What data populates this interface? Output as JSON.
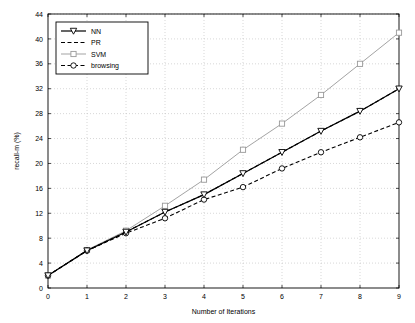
{
  "chart_data": {
    "type": "line",
    "title": "",
    "xlabel": "Number of Iterations",
    "ylabel": "recall-m (%)",
    "xlim": [
      0,
      9
    ],
    "ylim": [
      0,
      44
    ],
    "grid": true,
    "legend_position": "top-left",
    "x": [
      0,
      1,
      2,
      3,
      4,
      5,
      6,
      7,
      8,
      9
    ],
    "xticks": [
      "0",
      "1",
      "2",
      "3",
      "4",
      "5",
      "6",
      "7",
      "8",
      "9"
    ],
    "yticks": [
      "0",
      "4",
      "8",
      "12",
      "16",
      "20",
      "24",
      "28",
      "32",
      "36",
      "40",
      "44"
    ],
    "series": [
      {
        "name": "NN",
        "marker": "triangle-down",
        "line": "solid",
        "color": "#000000",
        "values": [
          2.0,
          6.0,
          9.0,
          12.2,
          15.0,
          18.4,
          21.8,
          25.2,
          28.4,
          32.0
        ]
      },
      {
        "name": "PR",
        "marker": "none",
        "line": "dashed",
        "color": "#000000",
        "values": [
          2.0,
          6.0,
          9.0,
          12.2,
          15.0,
          18.4,
          21.8,
          25.2,
          28.4,
          32.0
        ]
      },
      {
        "name": "SVM",
        "marker": "square",
        "line": "solid-light",
        "color": "#999999",
        "values": [
          2.0,
          6.1,
          9.2,
          13.2,
          17.4,
          22.2,
          26.4,
          31.0,
          36.0,
          41.0
        ]
      },
      {
        "name": "browsing",
        "marker": "circle",
        "line": "dashed",
        "color": "#000000",
        "values": [
          2.0,
          6.0,
          8.8,
          11.2,
          14.2,
          16.2,
          19.2,
          21.8,
          24.2,
          26.6
        ]
      }
    ]
  },
  "legend": {
    "items": [
      {
        "label": "NN"
      },
      {
        "label": "PR"
      },
      {
        "label": "SVM"
      },
      {
        "label": "browsing"
      }
    ]
  },
  "axes": {
    "x_title": "Number of Iterations",
    "y_title": "recall-m (%)"
  }
}
